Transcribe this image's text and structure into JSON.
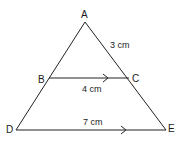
{
  "diagram": {
    "type": "triangle-with-parallel-line",
    "points": {
      "A": {
        "label": "A",
        "x": 85,
        "y": 22
      },
      "B": {
        "label": "B",
        "x": 49,
        "y": 78
      },
      "C": {
        "label": "C",
        "x": 129,
        "y": 78
      },
      "D": {
        "label": "D",
        "x": 16,
        "y": 130
      },
      "E": {
        "label": "E",
        "x": 166,
        "y": 130
      }
    },
    "measurements": {
      "AC": "3 cm",
      "BC": "4 cm",
      "DE": "7 cm"
    },
    "parallel": [
      "BC",
      "DE"
    ],
    "line_color": "#222222"
  }
}
